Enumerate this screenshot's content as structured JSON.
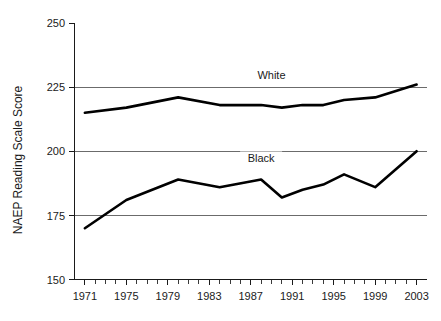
{
  "chart_data": {
    "type": "line",
    "title": "",
    "xlabel": "",
    "ylabel": "NAEP Reading Scale Score",
    "xlim": [
      1970,
      2004
    ],
    "ylim": [
      150,
      250
    ],
    "grid": "horizontal gridlines at 175, 200, 225",
    "legend_position": "inline labels above each series",
    "y_ticks": [
      150,
      175,
      200,
      225,
      250
    ],
    "y_tick_labels": [
      "150",
      "175",
      "200",
      "225",
      "250"
    ],
    "x_ticks": [
      1971,
      1975,
      1979,
      1983,
      1987,
      1991,
      1995,
      1999,
      2003
    ],
    "x_tick_labels": [
      "1971",
      "1975",
      "1979",
      "1983",
      "1987",
      "1991",
      "1995",
      "1999",
      "2003"
    ],
    "x_minor_tick_interval": 1,
    "x": [
      1971,
      1975,
      1980,
      1984,
      1988,
      1990,
      1992,
      1994,
      1996,
      1999,
      2003
    ],
    "series": [
      {
        "name": "White",
        "label": "White",
        "color": "#000000",
        "values": [
          215,
          217,
          221,
          218,
          218,
          217,
          218,
          218,
          220,
          221,
          226
        ]
      },
      {
        "name": "Black",
        "label": "Black",
        "color": "#000000",
        "values": [
          170,
          181,
          189,
          186,
          189,
          182,
          185,
          187,
          191,
          186,
          200
        ]
      }
    ],
    "annotations": [
      {
        "text": "White",
        "x": 1989,
        "y": 228
      },
      {
        "text": "Black",
        "x": 1988,
        "y": 196
      }
    ]
  }
}
